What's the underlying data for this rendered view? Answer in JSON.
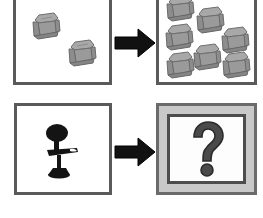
{
  "diagram": {
    "type": "2x2 transformation diagram",
    "background_color": "#ffffff",
    "rows": [
      {
        "row_id": "row-1-armchairs",
        "left_panel": {
          "name": "panel-source-multi",
          "label": "two armchairs",
          "border_color": "#5a5a5a",
          "fill_color": "#ffffff",
          "object_icon": "armchair-icon",
          "object_count": 2,
          "object_color": "#9b9b9b"
        },
        "operator": {
          "name": "arrow-right-icon",
          "label": "maps to",
          "color": "#111111"
        },
        "right_panel": {
          "name": "panel-result-many",
          "label": "seven armchairs",
          "border_color": "#5a5a5a",
          "fill_color": "#ffffff",
          "object_icon": "armchair-icon",
          "object_count": 7,
          "object_color": "#9b9b9b"
        }
      },
      {
        "row_id": "row-2-office-chair",
        "left_panel": {
          "name": "panel-source-single",
          "label": "one office chair",
          "border_color": "#5a5a5a",
          "fill_color": "#ffffff",
          "object_icon": "office-chair-icon",
          "object_count": 1,
          "object_color": "#141414"
        },
        "operator": {
          "name": "arrow-right-icon",
          "label": "maps to",
          "color": "#111111"
        },
        "right_panel": {
          "name": "panel-result-unknown",
          "label": "unknown outcome",
          "border_color": "#6b6b6b",
          "frame_fill_color": "#c9c9c9",
          "inner_fill_color": "#fdfdfd",
          "inner_border_color": "#4d4d4d",
          "object_icon": "question-mark-icon",
          "object_count": 1,
          "object_color": "#4a4a4a",
          "glyph": "?"
        }
      }
    ]
  }
}
